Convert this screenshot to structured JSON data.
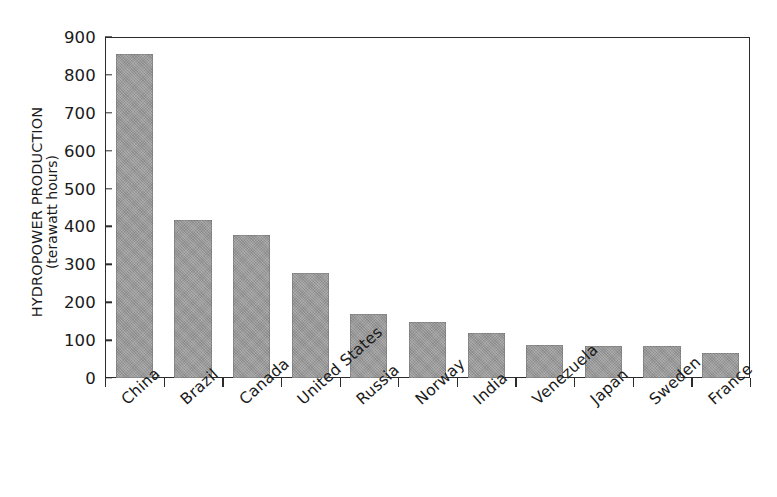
{
  "chart_data": {
    "type": "bar",
    "title": "",
    "subtitle": "",
    "xlabel": "",
    "ylabel": "HYDROPOWER PRODUCTION",
    "ylabel_sub": "(terawatt hours)",
    "categories": [
      "China",
      "Brazil",
      "Canada",
      "United States",
      "Russia",
      "Norway",
      "India",
      "Venezuela",
      "Japan",
      "Sweden",
      "France"
    ],
    "values": [
      855,
      418,
      378,
      278,
      168,
      147,
      119,
      87,
      85,
      85,
      65
    ],
    "ylim": [
      0,
      900
    ],
    "ytick_values": [
      900,
      800,
      700,
      600,
      500,
      400,
      300,
      200,
      100,
      0
    ],
    "ytick_labels": [
      "900",
      "800",
      "700",
      "600",
      "500",
      "400",
      "300",
      "200",
      "100",
      "0"
    ],
    "grid": false,
    "legend": false,
    "legend_position": "none",
    "bar_color": "#9a9a9a",
    "axis_color": "#2b2b2b",
    "background_color": "#ffffff",
    "xtick_label_rotation": -42
  },
  "axis": {
    "y_title_main": "HYDROPOWER PRODUCTION",
    "y_title_sub": "(terawatt hours)"
  }
}
